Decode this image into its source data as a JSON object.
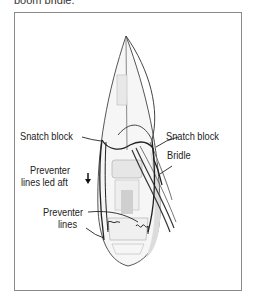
{
  "caption": {
    "partial_text": "boom bridle."
  },
  "labels": {
    "snatch_block_left": "Snatch block",
    "snatch_block_right": "Snatch block",
    "bridle": "Bridle",
    "preventer_led_aft_line1": "Preventer",
    "preventer_led_aft_line2": "lines led aft",
    "preventer_lines_line1": "Preventer",
    "preventer_lines_line2": "lines"
  },
  "colors": {
    "frame": "#8a8a8a",
    "hull_outline": "#555555",
    "line": "#222222",
    "deck_fill": "#eeeeee"
  }
}
